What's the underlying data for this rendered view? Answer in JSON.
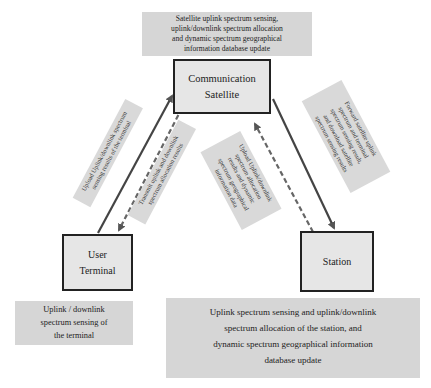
{
  "diagram": {
    "nodes": {
      "satellite": {
        "lines": [
          "Communication",
          "Satellite"
        ]
      },
      "terminal": {
        "lines": [
          "User",
          "Terminal"
        ]
      },
      "station": {
        "lines": [
          "Station"
        ]
      }
    },
    "captions": {
      "satellite": [
        "Satellite uplink spectrum sensing,",
        "uplink/downlink spectrum allocation",
        "and dynamic spectrum geographical",
        "information database update"
      ],
      "terminal": [
        "Uplink / downlink",
        "spectrum sensing of",
        "the terminal"
      ],
      "station": [
        "Uplink spectrum sensing and uplink/downlink",
        "spectrum allocation of the station, and",
        "dynamic spectrum geographical information",
        "database update"
      ]
    },
    "edges": [
      {
        "id": "terminal-to-satellite",
        "from": "User Terminal",
        "to": "Communication Satellite",
        "style": "solid",
        "label": [
          "Upload Uplink/downlink spectrum",
          "sensing results of the terminal"
        ]
      },
      {
        "id": "satellite-to-terminal",
        "from": "Communication Satellite",
        "to": "User Terminal",
        "style": "dashed",
        "label": [
          "Transmit uplink and downlink",
          "spectrum allocation results"
        ]
      },
      {
        "id": "station-to-satellite",
        "from": "Station",
        "to": "Communication Satellite",
        "style": "dashed",
        "label": [
          "Upload Uplink/downlink",
          "spectrum allocation",
          "results and dynamic",
          "spectrum geographical",
          "information data"
        ]
      },
      {
        "id": "satellite-to-station",
        "from": "Communication Satellite",
        "to": "Station",
        "style": "solid",
        "label": [
          "Forward satellite uplink",
          "spectrum and terminal",
          "spectrum sensing result,",
          "and download satellite",
          "spectrum sensing results"
        ]
      }
    ],
    "colors": {
      "caption_bg": "#d6d6d6",
      "node_bg": "#e6e6e6",
      "stroke": "#444444"
    }
  }
}
